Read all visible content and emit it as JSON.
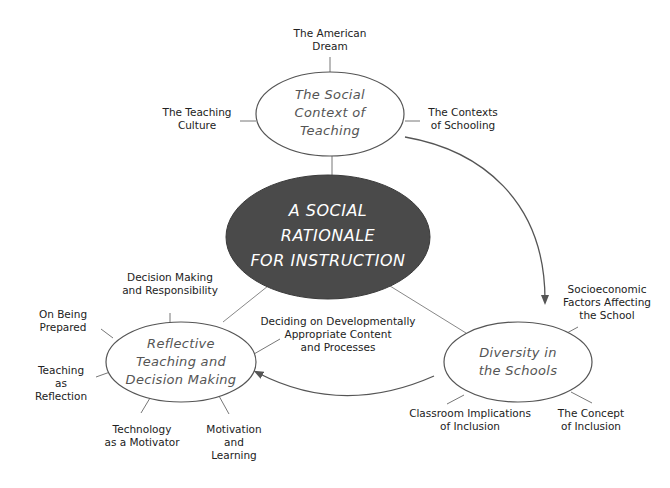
{
  "diagram": {
    "center": {
      "lines": [
        "A SOCIAL",
        "RATIONALE",
        "FOR INSTRUCTION"
      ],
      "fill": "#4a4a4a"
    },
    "nodes": [
      {
        "id": "social-context",
        "lines": [
          "The Social",
          "Context of",
          "Teaching"
        ],
        "subtopics": [
          {
            "lines": [
              "The American",
              "Dream"
            ]
          },
          {
            "lines": [
              "The Teaching",
              "Culture"
            ]
          },
          {
            "lines": [
              "The Contexts",
              "of Schooling"
            ]
          }
        ]
      },
      {
        "id": "diversity",
        "lines": [
          "Diversity in",
          "the Schools"
        ],
        "subtopics": [
          {
            "lines": [
              "Socioeconomic",
              "Factors Affecting",
              "the School"
            ]
          },
          {
            "lines": [
              "Classroom Implications",
              "of Inclusion"
            ]
          },
          {
            "lines": [
              "The Concept",
              "of Inclusion"
            ]
          }
        ]
      },
      {
        "id": "reflective",
        "lines": [
          "Reflective",
          "Teaching and",
          "Decision Making"
        ],
        "subtopics": [
          {
            "lines": [
              "Decision Making",
              "and Responsibility"
            ]
          },
          {
            "lines": [
              "On Being",
              "Prepared"
            ]
          },
          {
            "lines": [
              "Teaching",
              "as",
              "Reflection"
            ]
          },
          {
            "lines": [
              "Technology",
              "as a Motivator"
            ]
          },
          {
            "lines": [
              "Motivation",
              "and",
              "Learning"
            ]
          },
          {
            "lines": [
              "Deciding on Developmentally",
              "Appropriate Content",
              "and Processes"
            ]
          }
        ]
      }
    ],
    "colors": {
      "line": "#777777",
      "outline": "#555555",
      "text": "#222222"
    }
  }
}
